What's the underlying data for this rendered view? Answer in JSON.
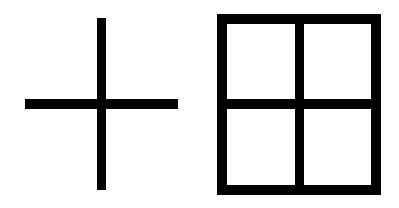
{
  "figures": [
    {
      "name": "plus-cross",
      "shape": "cross",
      "color": "#000000"
    },
    {
      "name": "window-grid",
      "shape": "2x2 grid window",
      "color": "#000000"
    }
  ],
  "background": "#ffffff"
}
